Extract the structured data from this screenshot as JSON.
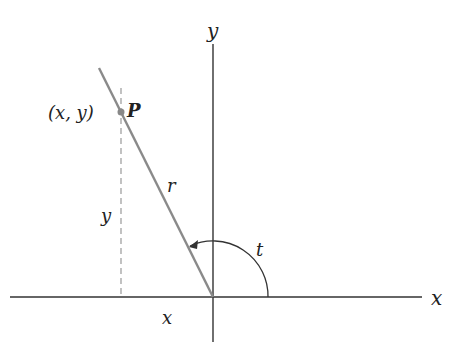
{
  "diagram": {
    "axes": {
      "x_label": "x",
      "y_label": "y"
    },
    "point": {
      "name": "P",
      "coords_label": "(x, y)"
    },
    "segments": {
      "radius_label": "r",
      "vertical_label": "y",
      "horizontal_label": "x"
    },
    "angle": {
      "label": "t"
    },
    "colors": {
      "axis": "#333333",
      "ray": "#8a8a8a",
      "dashed": "#999999",
      "point": "#888888"
    }
  }
}
